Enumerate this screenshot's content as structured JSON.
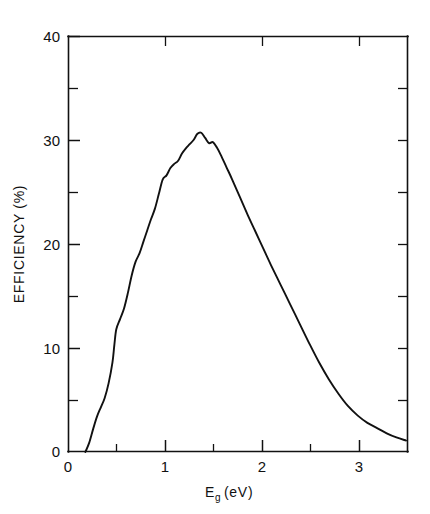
{
  "chart_data": {
    "type": "line",
    "title": "",
    "xlabel": "Eg (eV)",
    "xlabel_main": "E",
    "xlabel_sub": "g",
    "xlabel_unit": "(eV)",
    "ylabel": "EFFICIENCY (%)",
    "xlim": [
      0,
      3.52
    ],
    "ylim": [
      0,
      40
    ],
    "grid": false,
    "legend": null,
    "x_major_ticks": [
      0,
      1,
      2,
      3
    ],
    "x_major_tick_labels": [
      "0",
      "1",
      "2",
      "3"
    ],
    "x_minor_ticks": [
      0.5,
      1.5,
      2.5,
      3.5
    ],
    "y_major_ticks": [
      0,
      10,
      20,
      30,
      40
    ],
    "y_major_tick_labels": [
      "0",
      "10",
      "20",
      "30",
      "40"
    ],
    "y_minor_ticks": [
      5,
      15,
      25,
      35
    ],
    "series": [
      {
        "name": "efficiency",
        "x": [
          0.18,
          0.22,
          0.26,
          0.3,
          0.34,
          0.38,
          0.42,
          0.46,
          0.48,
          0.5,
          0.54,
          0.58,
          0.62,
          0.66,
          0.7,
          0.74,
          0.78,
          0.82,
          0.86,
          0.9,
          0.94,
          0.98,
          1.02,
          1.06,
          1.1,
          1.14,
          1.18,
          1.22,
          1.26,
          1.3,
          1.34,
          1.38,
          1.42,
          1.46,
          1.5,
          1.54,
          1.58,
          1.64,
          1.7,
          1.78,
          1.86,
          1.94,
          2.02,
          2.1,
          2.2,
          2.3,
          2.4,
          2.5,
          2.6,
          2.7,
          2.8,
          2.9,
          3.0,
          3.1,
          3.2,
          3.3,
          3.4,
          3.5
        ],
        "y": [
          0.0,
          0.9,
          2.2,
          3.4,
          4.3,
          5.2,
          6.6,
          8.6,
          10.3,
          11.8,
          12.8,
          13.8,
          15.3,
          17.0,
          18.3,
          19.1,
          20.2,
          21.3,
          22.4,
          23.4,
          24.8,
          26.2,
          26.6,
          27.3,
          27.7,
          28.0,
          28.7,
          29.2,
          29.6,
          30.0,
          30.6,
          30.7,
          30.2,
          29.7,
          29.8,
          29.3,
          28.6,
          27.4,
          26.2,
          24.5,
          22.8,
          21.2,
          19.6,
          18.0,
          16.1,
          14.2,
          12.3,
          10.4,
          8.6,
          7.0,
          5.6,
          4.4,
          3.5,
          2.8,
          2.3,
          1.8,
          1.4,
          1.1
        ],
        "peak_x": 1.38,
        "peak_y": 30.7,
        "onset_x": 0.18,
        "end_y": 1.1
      }
    ]
  },
  "axes_geometry": {
    "plot_left": 68,
    "plot_right": 408,
    "plot_top": 36,
    "plot_bottom": 452
  }
}
